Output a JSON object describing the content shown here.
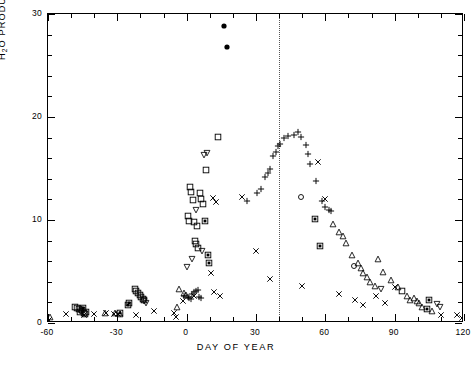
{
  "axes": {
    "x": {
      "title": "DAY OF YEAR",
      "min": -60,
      "max": 120,
      "ticks": [
        -60,
        -30,
        0,
        30,
        60,
        90,
        120
      ],
      "tick_labels": [
        "-60",
        "-30",
        "0",
        "30",
        "60",
        "90",
        "120"
      ],
      "minor_step": 10
    },
    "y": {
      "title_plain": "H2O PRODUCTION RATE (1029 s-1)",
      "title_parts": {
        "h": "H",
        "two": "2",
        "o": "O PRODUCTION RATE (10",
        "exp": "29",
        "mid": " s",
        "exp2": "-1",
        "close": " )"
      },
      "min": 0,
      "max": 30,
      "ticks": [
        0,
        10,
        20,
        30
      ],
      "tick_labels": [
        "0",
        "10",
        "20",
        "30"
      ],
      "minor_step": 2
    },
    "grid": false,
    "frame": "box"
  },
  "annotations": [
    {
      "name": "perihelion-line",
      "type": "vline",
      "x": 40,
      "style": "dotted"
    }
  ],
  "caption": "",
  "chart_data": {
    "type": "scatter",
    "title": "",
    "xlabel": "DAY OF YEAR",
    "ylabel": "H2O PRODUCTION RATE (10^29 s^-1)",
    "xlim": [
      -60,
      120
    ],
    "ylim": [
      0,
      30
    ],
    "grid": false,
    "legend_position": "none",
    "series": [
      {
        "name": "open-square",
        "marker": "square-open",
        "points": [
          [
            -48.5,
            1.6
          ],
          [
            -47.4,
            1.5
          ],
          [
            -46.6,
            1.35
          ],
          [
            -46.0,
            1.1
          ],
          [
            -45.2,
            1.25
          ],
          [
            -44.6,
            1.0
          ],
          [
            -44.0,
            0.85
          ],
          [
            -43.4,
            1.05
          ],
          [
            -22.5,
            3.3
          ],
          [
            -21.8,
            3.1
          ],
          [
            -21.0,
            2.9
          ],
          [
            -20.3,
            2.7
          ],
          [
            -19.6,
            2.5
          ],
          [
            -19.0,
            2.35
          ],
          [
            -18.4,
            2.2
          ],
          [
            3.5,
            8.0
          ],
          [
            4.2,
            7.7
          ],
          [
            5.0,
            7.3
          ],
          [
            5.8,
            12.6
          ],
          [
            6.4,
            12.0
          ],
          [
            7.1,
            11.6
          ],
          [
            3.0,
            9.8
          ],
          [
            4.6,
            9.4
          ],
          [
            1.4,
            13.2
          ],
          [
            2.0,
            12.7
          ],
          [
            2.6,
            11.9
          ],
          [
            0.6,
            10.4
          ],
          [
            1.0,
            9.9
          ],
          [
            13.5,
            18.1
          ],
          [
            8.2,
            14.9
          ],
          [
            93.0,
            3.1
          ]
        ]
      },
      {
        "name": "filled-square",
        "marker": "square-filled",
        "points": [
          [
            -45.0,
            1.45
          ],
          [
            -29.0,
            1.0
          ],
          [
            -25.5,
            1.75
          ],
          [
            -24.8,
            1.9
          ],
          [
            8.0,
            9.9
          ],
          [
            9.2,
            6.6
          ],
          [
            9.8,
            5.8
          ],
          [
            55.5,
            10.1
          ],
          [
            57.8,
            7.5
          ],
          [
            105.0,
            2.2
          ],
          [
            104.0,
            1.4
          ]
        ]
      },
      {
        "name": "cross-x",
        "marker": "x",
        "points": [
          [
            -59.5,
            0.25
          ],
          [
            -52.0,
            0.9
          ],
          [
            -44.5,
            0.75
          ],
          [
            -40.0,
            0.9
          ],
          [
            -35.0,
            1.0
          ],
          [
            -31.5,
            0.85
          ],
          [
            -29.5,
            0.85
          ],
          [
            -22.0,
            0.8
          ],
          [
            -14.0,
            1.2
          ],
          [
            -5.5,
            1.0
          ],
          [
            -4.5,
            0.6
          ],
          [
            -1.5,
            2.1
          ],
          [
            3.0,
            2.6
          ],
          [
            11.5,
            12.1
          ],
          [
            12.8,
            11.7
          ],
          [
            10.4,
            4.9
          ],
          [
            12.0,
            3.0
          ],
          [
            14.5,
            2.6
          ],
          [
            24.0,
            12.2
          ],
          [
            30.0,
            7.0
          ],
          [
            36.0,
            4.3
          ],
          [
            50.0,
            3.6
          ],
          [
            57.0,
            15.6
          ],
          [
            60.0,
            12.0
          ],
          [
            66.0,
            2.8
          ],
          [
            73.0,
            2.2
          ],
          [
            76.5,
            1.7
          ],
          [
            82.0,
            2.6
          ],
          [
            86.0,
            1.9
          ],
          [
            90.0,
            3.5
          ],
          [
            110.0,
            0.75
          ],
          [
            117.0,
            0.8
          ],
          [
            119.0,
            0.5
          ]
        ]
      },
      {
        "name": "plus",
        "marker": "plus",
        "points": [
          [
            -1.0,
            2.6
          ],
          [
            0.5,
            2.5
          ],
          [
            1.2,
            2.4
          ],
          [
            1.8,
            2.3
          ],
          [
            2.4,
            2.8
          ],
          [
            3.2,
            3.0
          ],
          [
            4.0,
            3.1
          ],
          [
            4.8,
            3.2
          ],
          [
            5.5,
            2.5
          ],
          [
            6.2,
            2.4
          ],
          [
            26.0,
            11.8
          ],
          [
            30.5,
            12.6
          ],
          [
            32.0,
            13.0
          ],
          [
            34.0,
            14.2
          ],
          [
            35.0,
            14.6
          ],
          [
            36.0,
            15.0
          ],
          [
            37.5,
            16.2
          ],
          [
            38.5,
            16.6
          ],
          [
            39.5,
            17.2
          ],
          [
            40.5,
            17.4
          ],
          [
            42.0,
            18.0
          ],
          [
            44.0,
            18.2
          ],
          [
            46.5,
            18.3
          ],
          [
            48.0,
            18.5
          ],
          [
            49.5,
            18.1
          ],
          [
            51.5,
            17.3
          ],
          [
            52.5,
            16.4
          ],
          [
            53.5,
            15.4
          ],
          [
            56.0,
            13.8
          ],
          [
            58.5,
            11.8
          ],
          [
            60.0,
            11.3
          ],
          [
            61.5,
            11.0
          ],
          [
            62.5,
            10.9
          ]
        ]
      },
      {
        "name": "triangle",
        "marker": "triangle-open",
        "points": [
          [
            -59.0,
            0.6
          ],
          [
            -35.5,
            0.95
          ],
          [
            -31.0,
            1.0
          ],
          [
            -29.0,
            0.9
          ],
          [
            -3.5,
            3.3
          ],
          [
            -1.0,
            2.9
          ],
          [
            -0.2,
            2.7
          ],
          [
            -4.0,
            1.6
          ],
          [
            63.5,
            9.6
          ],
          [
            66.0,
            8.8
          ],
          [
            67.5,
            8.4
          ],
          [
            69.0,
            7.8
          ],
          [
            71.5,
            6.6
          ],
          [
            74.0,
            5.8
          ],
          [
            75.5,
            5.3
          ],
          [
            76.5,
            4.9
          ],
          [
            78.0,
            4.5
          ],
          [
            79.5,
            4.0
          ],
          [
            81.5,
            3.6
          ],
          [
            83.0,
            6.2
          ],
          [
            85.0,
            5.0
          ],
          [
            88.5,
            4.2
          ],
          [
            91.5,
            3.5
          ],
          [
            95.5,
            2.6
          ],
          [
            96.5,
            2.2
          ],
          [
            98.5,
            2.4
          ],
          [
            99.5,
            2.1
          ],
          [
            100.5,
            1.9
          ],
          [
            102.0,
            1.6
          ],
          [
            106.0,
            1.2
          ]
        ]
      },
      {
        "name": "open-diamond-nabla",
        "marker": "nabla",
        "points": [
          [
            -18.5,
            2.1
          ],
          [
            -17.8,
            1.9
          ],
          [
            0.2,
            5.4
          ],
          [
            2.2,
            6.2
          ],
          [
            4.0,
            11.0
          ],
          [
            6.8,
            7.0
          ],
          [
            8.6,
            16.5
          ],
          [
            7.4,
            16.3
          ],
          [
            84.0,
            3.3
          ],
          [
            108.5,
            1.8
          ],
          [
            109.5,
            1.6
          ]
        ]
      },
      {
        "name": "open-circle",
        "marker": "circle-open",
        "points": [
          [
            -45.6,
            1.2
          ],
          [
            49.5,
            12.2
          ],
          [
            72.5,
            5.5
          ]
        ]
      },
      {
        "name": "filled-circle",
        "marker": "circle-filled",
        "points": [
          [
            16.0,
            28.8
          ],
          [
            17.5,
            26.8
          ]
        ]
      }
    ]
  }
}
